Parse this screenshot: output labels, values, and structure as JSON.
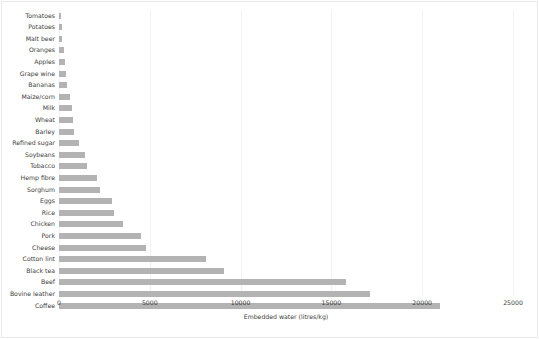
{
  "chart_data": {
    "type": "bar",
    "orientation": "horizontal",
    "title": "",
    "xlabel": "Embedded water (litres/kg)",
    "ylabel": "",
    "xlim": [
      0,
      25000
    ],
    "xticks": [
      0,
      5000,
      10000,
      15000,
      20000,
      25000
    ],
    "xtick_labels": [
      "0",
      "5000",
      "10000",
      "15000",
      "20000",
      "25000"
    ],
    "grid": true,
    "legend": null,
    "bar_color": "#b3b3b3",
    "categories": [
      "Tomatoes",
      "Potatoes",
      "Malt beer",
      "Oranges",
      "Apples",
      "Grape wine",
      "Bananas",
      "Maize/corn",
      "Milk",
      "Wheat",
      "Barley",
      "Refined sugar",
      "Soybeans",
      "Tobacco",
      "Hemp fibre",
      "Sorghum",
      "Eggs",
      "Rice",
      "Chicken",
      "Pork",
      "Cheese",
      "Cotton lint",
      "Black tea",
      "Beef",
      "Bovine leather",
      "Coffee"
    ],
    "values": [
      110,
      160,
      190,
      290,
      320,
      400,
      450,
      620,
      690,
      780,
      830,
      1100,
      1450,
      1550,
      2100,
      2250,
      2900,
      3050,
      3500,
      4500,
      4800,
      8100,
      9100,
      15800,
      17100,
      21000
    ]
  }
}
